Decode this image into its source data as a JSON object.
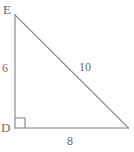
{
  "figure": {
    "kind": "right-triangle-diagram",
    "background_color": "#ffffff",
    "stroke_color": "#808080",
    "text_color": "#6b6b6b",
    "width": 134,
    "height": 152,
    "vertices": {
      "E": {
        "label": "E",
        "x": 15,
        "y": 15
      },
      "D": {
        "label": "D",
        "x": 15,
        "y": 128
      },
      "F": {
        "label": "",
        "x": 128,
        "y": 128
      }
    },
    "right_angle": {
      "at_vertex": "D",
      "marker": "square",
      "size": 10
    },
    "sides": [
      {
        "name": "vertical-leg",
        "from": "E",
        "to": "D",
        "label": "6",
        "label_x": 2,
        "label_y": 62
      },
      {
        "name": "horizontal-leg",
        "from": "D",
        "to": "F",
        "label": "8",
        "label_x": 67,
        "label_y": 135
      },
      {
        "name": "hypotenuse",
        "from": "E",
        "to": "F",
        "label": "10",
        "label_x": 79,
        "label_y": 61
      }
    ],
    "labels": {
      "vertex_top": "E",
      "vertex_corner": "D",
      "leg_vertical": "6",
      "leg_horizontal": "8",
      "hypotenuse": "10"
    }
  }
}
